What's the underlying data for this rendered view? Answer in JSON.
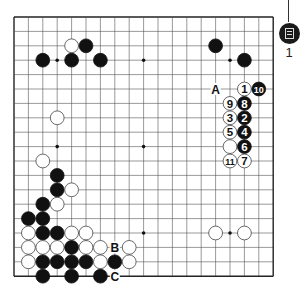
{
  "board": {
    "size": 19,
    "origin_x": 14,
    "origin_y": 17,
    "spacing": 14.4,
    "line_color": "#555555",
    "edge_color": "#222222",
    "hoshi": [
      [
        3,
        3
      ],
      [
        9,
        3
      ],
      [
        15,
        3
      ],
      [
        3,
        9
      ],
      [
        9,
        9
      ],
      [
        15,
        9
      ],
      [
        3,
        15
      ],
      [
        9,
        15
      ],
      [
        15,
        15
      ]
    ],
    "stones": [
      {
        "c": 4,
        "r": 2,
        "color": "white"
      },
      {
        "c": 5,
        "r": 2,
        "color": "black"
      },
      {
        "c": 2,
        "r": 3,
        "color": "black"
      },
      {
        "c": 4,
        "r": 3,
        "color": "black"
      },
      {
        "c": 6,
        "r": 3,
        "color": "black"
      },
      {
        "c": 14,
        "r": 2,
        "color": "black"
      },
      {
        "c": 16,
        "r": 3,
        "color": "black"
      },
      {
        "c": 3,
        "r": 7,
        "color": "white"
      },
      {
        "c": 16,
        "r": 5,
        "color": "white",
        "label": "1"
      },
      {
        "c": 17,
        "r": 5,
        "color": "black",
        "label": "10"
      },
      {
        "c": 15,
        "r": 6,
        "color": "white",
        "label": "9"
      },
      {
        "c": 16,
        "r": 6,
        "color": "black",
        "label": "8"
      },
      {
        "c": 15,
        "r": 7,
        "color": "white",
        "label": "3"
      },
      {
        "c": 16,
        "r": 7,
        "color": "black",
        "label": "2"
      },
      {
        "c": 15,
        "r": 8,
        "color": "white",
        "label": "5"
      },
      {
        "c": 16,
        "r": 8,
        "color": "black",
        "label": "4"
      },
      {
        "c": 15,
        "r": 9,
        "color": "white"
      },
      {
        "c": 16,
        "r": 9,
        "color": "black",
        "label": "6"
      },
      {
        "c": 15,
        "r": 10,
        "color": "white",
        "label": "11"
      },
      {
        "c": 16,
        "r": 10,
        "color": "white",
        "label": "7"
      },
      {
        "c": 2,
        "r": 10,
        "color": "white"
      },
      {
        "c": 3,
        "r": 11,
        "color": "black"
      },
      {
        "c": 3,
        "r": 12,
        "color": "black"
      },
      {
        "c": 4,
        "r": 12,
        "color": "white"
      },
      {
        "c": 2,
        "r": 13,
        "color": "black"
      },
      {
        "c": 3,
        "r": 13,
        "color": "white"
      },
      {
        "c": 1,
        "r": 14,
        "color": "black"
      },
      {
        "c": 2,
        "r": 14,
        "color": "black"
      },
      {
        "c": 1,
        "r": 15,
        "color": "white"
      },
      {
        "c": 2,
        "r": 15,
        "color": "black"
      },
      {
        "c": 3,
        "r": 15,
        "color": "black"
      },
      {
        "c": 4,
        "r": 15,
        "color": "white"
      },
      {
        "c": 5,
        "r": 15,
        "color": "white"
      },
      {
        "c": 1,
        "r": 16,
        "color": "white"
      },
      {
        "c": 2,
        "r": 16,
        "color": "white"
      },
      {
        "c": 3,
        "r": 16,
        "color": "white"
      },
      {
        "c": 4,
        "r": 16,
        "color": "black"
      },
      {
        "c": 5,
        "r": 16,
        "color": "white"
      },
      {
        "c": 6,
        "r": 16,
        "color": "white"
      },
      {
        "c": 8,
        "r": 16,
        "color": "white"
      },
      {
        "c": 1,
        "r": 17,
        "color": "white"
      },
      {
        "c": 2,
        "r": 17,
        "color": "black"
      },
      {
        "c": 3,
        "r": 17,
        "color": "black"
      },
      {
        "c": 4,
        "r": 17,
        "color": "black"
      },
      {
        "c": 5,
        "r": 17,
        "color": "black"
      },
      {
        "c": 6,
        "r": 17,
        "color": "white"
      },
      {
        "c": 7,
        "r": 17,
        "color": "black"
      },
      {
        "c": 8,
        "r": 17,
        "color": "white"
      },
      {
        "c": 2,
        "r": 18,
        "color": "black"
      },
      {
        "c": 4,
        "r": 18,
        "color": "black"
      },
      {
        "c": 6,
        "r": 18,
        "color": "black"
      },
      {
        "c": 14,
        "r": 15,
        "color": "white"
      },
      {
        "c": 16,
        "r": 15,
        "color": "white"
      }
    ],
    "markers": [
      {
        "c": 14,
        "r": 5,
        "label": "A"
      },
      {
        "c": 7,
        "r": 16,
        "label": "B"
      },
      {
        "c": 7,
        "r": 18,
        "label": "C"
      }
    ]
  },
  "side_marker": {
    "icon": "document-icon",
    "number": "1"
  }
}
